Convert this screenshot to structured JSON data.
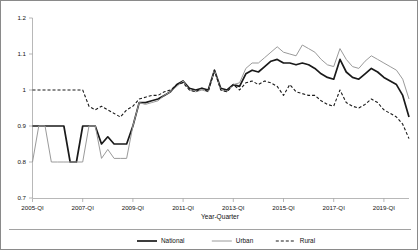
{
  "chart_data": {
    "type": "line",
    "title": "",
    "xlabel": "Year-Quarter",
    "ylabel": "",
    "ylim": [
      0.7,
      1.2
    ],
    "yticks": [
      "0.7",
      "0.8",
      "0.9",
      "1",
      "1.1",
      "1.2"
    ],
    "ytick_values": [
      0.7,
      0.8,
      0.9,
      1.0,
      1.1,
      1.2
    ],
    "grid": false,
    "legend_position": "bottom",
    "xtick_labels": [
      "2005-QI",
      "2007-QI",
      "2009-QI",
      "2011-QI",
      "2013-QI",
      "2015-QI",
      "2017-QI",
      "2019-QI"
    ],
    "xtick_indices": [
      0,
      8,
      16,
      24,
      32,
      40,
      48,
      56
    ],
    "x_count": 61,
    "x": [
      "2005-QI",
      "2005-QII",
      "2005-QIII",
      "2005-QIV",
      "2006-QI",
      "2006-QII",
      "2006-QIII",
      "2006-QIV",
      "2007-QI",
      "2007-QII",
      "2007-QIII",
      "2007-QIV",
      "2008-QI",
      "2008-QII",
      "2008-QIII",
      "2008-QIV",
      "2009-QI",
      "2009-QII",
      "2009-QIII",
      "2009-QIV",
      "2010-QI",
      "2010-QII",
      "2010-QIII",
      "2010-QIV",
      "2011-QI",
      "2011-QII",
      "2011-QIII",
      "2011-QIV",
      "2012-QI",
      "2012-QII",
      "2012-QIII",
      "2012-QIV",
      "2013-QI",
      "2013-QII",
      "2013-QIII",
      "2013-QIV",
      "2014-QI",
      "2014-QII",
      "2014-QIII",
      "2014-QIV",
      "2015-QI",
      "2015-QII",
      "2015-QIII",
      "2015-QIV",
      "2016-QI",
      "2016-QII",
      "2016-QIII",
      "2016-QIV",
      "2017-QI",
      "2017-QII",
      "2017-QIII",
      "2017-QIV",
      "2018-QI",
      "2018-QII",
      "2018-QIII",
      "2018-QIV",
      "2019-QI",
      "2019-QII",
      "2019-QIII",
      "2019-QIV",
      "2020-QI"
    ],
    "series": [
      {
        "name": "National",
        "color": "#1a1a1a",
        "width": 1.7,
        "dash": "none",
        "values": [
          0.9,
          0.9,
          0.9,
          0.9,
          0.9,
          0.9,
          0.8,
          0.8,
          0.9,
          0.9,
          0.9,
          0.85,
          0.87,
          0.85,
          0.85,
          0.85,
          0.9,
          0.965,
          0.965,
          0.97,
          0.975,
          0.985,
          0.995,
          1.015,
          1.025,
          1.005,
          1.0,
          1.005,
          1.0,
          1.055,
          1.005,
          1.0,
          1.015,
          1.01,
          1.045,
          1.055,
          1.05,
          1.065,
          1.08,
          1.085,
          1.075,
          1.075,
          1.07,
          1.075,
          1.07,
          1.06,
          1.045,
          1.035,
          1.03,
          1.085,
          1.05,
          1.035,
          1.03,
          1.045,
          1.06,
          1.05,
          1.035,
          1.025,
          1.015,
          0.985,
          0.925
        ]
      },
      {
        "name": "Urban",
        "color": "#9a9a9a",
        "width": 1.0,
        "dash": "none",
        "values": [
          0.8,
          0.9,
          0.9,
          0.8,
          0.8,
          0.8,
          0.8,
          0.8,
          0.8,
          0.9,
          0.9,
          0.81,
          0.835,
          0.81,
          0.81,
          0.81,
          0.9,
          0.965,
          0.96,
          0.965,
          0.97,
          0.985,
          0.995,
          1.01,
          1.025,
          1.0,
          0.995,
          1.0,
          0.995,
          1.055,
          1.0,
          0.995,
          1.015,
          1.02,
          1.06,
          1.075,
          1.075,
          1.09,
          1.105,
          1.12,
          1.105,
          1.1,
          1.095,
          1.125,
          1.115,
          1.105,
          1.085,
          1.07,
          1.065,
          1.115,
          1.085,
          1.065,
          1.06,
          1.08,
          1.095,
          1.085,
          1.075,
          1.065,
          1.055,
          1.03,
          0.975
        ]
      },
      {
        "name": "Rural",
        "color": "#1a1a1a",
        "width": 1.1,
        "dash": "3,2",
        "values": [
          1.0,
          1.0,
          1.0,
          1.0,
          1.0,
          1.0,
          1.0,
          1.0,
          1.0,
          0.955,
          0.945,
          0.955,
          0.945,
          0.935,
          0.925,
          0.945,
          0.955,
          0.975,
          0.98,
          0.985,
          0.985,
          0.995,
          1.0,
          1.015,
          1.02,
          1.0,
          0.995,
          1.005,
          0.995,
          1.055,
          1.0,
          0.995,
          1.015,
          1.0,
          1.02,
          1.025,
          1.015,
          1.025,
          1.02,
          1.01,
          0.985,
          1.015,
          0.995,
          0.99,
          0.985,
          0.985,
          0.97,
          0.96,
          0.955,
          1.0,
          0.965,
          0.955,
          0.95,
          0.96,
          0.975,
          0.965,
          0.945,
          0.935,
          0.925,
          0.905,
          0.865
        ]
      }
    ]
  },
  "legend": {
    "entries": [
      {
        "label": "National"
      },
      {
        "label": "Urban"
      },
      {
        "label": "Rural"
      }
    ]
  },
  "axis": {
    "x_title": "Year-Quarter"
  }
}
